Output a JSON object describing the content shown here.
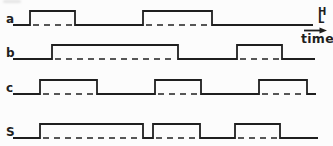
{
  "figure": {
    "background": "#fcfcfc",
    "stroke_color": "#1f1f1f",
    "axis": {
      "high_label": "H",
      "low_label": "L",
      "time_label": "time"
    },
    "waveforms": [
      {
        "label": "a",
        "low_y": 25,
        "high_y": 11,
        "x_start": 13,
        "x_end": 313,
        "edges": [
          30,
          75,
          143,
          212
        ]
      },
      {
        "label": "b",
        "low_y": 59,
        "high_y": 45,
        "x_start": 13,
        "x_end": 315,
        "edges": [
          52,
          178,
          237,
          282
        ]
      },
      {
        "label": "c",
        "low_y": 94,
        "high_y": 80,
        "x_start": 13,
        "x_end": 316,
        "edges": [
          40,
          97,
          155,
          201,
          259,
          307
        ]
      },
      {
        "label": "S",
        "low_y": 138,
        "high_y": 124,
        "x_start": 13,
        "x_end": 318,
        "edges": [
          40,
          143,
          153,
          200,
          235,
          280
        ]
      }
    ]
  },
  "chart_data": {
    "type": "line",
    "subtype": "digital-timing-diagram",
    "title": "",
    "xlabel": "time",
    "ylabels": [
      "H",
      "L"
    ],
    "grid": false,
    "legend": "signal names at left of each trace",
    "series": [
      {
        "name": "a",
        "initial_level": "L",
        "transition_x_px": [
          30,
          75,
          143,
          212
        ]
      },
      {
        "name": "b",
        "initial_level": "L",
        "transition_x_px": [
          52,
          178,
          237,
          282
        ]
      },
      {
        "name": "c",
        "initial_level": "L",
        "transition_x_px": [
          40,
          97,
          155,
          201,
          259,
          307
        ]
      },
      {
        "name": "S",
        "initial_level": "L",
        "transition_x_px": [
          40,
          143,
          153,
          200,
          235,
          280
        ]
      }
    ]
  }
}
